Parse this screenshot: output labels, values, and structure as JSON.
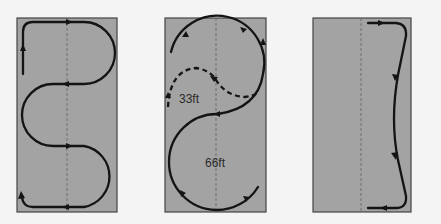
{
  "diagrams": [
    {
      "name": "serpentine-pattern",
      "box": {
        "x": 17,
        "y": 18,
        "width": 100,
        "height": 194
      },
      "centerline_x": 67
    },
    {
      "name": "figure-s-pattern",
      "box": {
        "x": 165,
        "y": 18,
        "width": 101,
        "height": 194
      },
      "centerline_x": 216,
      "labels": [
        {
          "text": "33ft",
          "x": 179,
          "y": 103
        },
        {
          "text": "66ft",
          "x": 205,
          "y": 167
        }
      ]
    },
    {
      "name": "edge-pattern",
      "box": {
        "x": 313,
        "y": 18,
        "width": 98,
        "height": 194
      },
      "centerline_x": 361
    }
  ],
  "colors": {
    "background": "#f4f4f4",
    "field_fill": "#a3a3a3",
    "field_border": "#444444",
    "path": "#141414",
    "centerline": "#6a6a6a",
    "label": "#2a2a2a"
  }
}
